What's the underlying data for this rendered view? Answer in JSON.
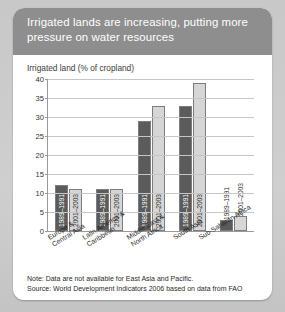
{
  "card": {
    "title": "Irrigated lands are increasing, putting more pressure on water resources"
  },
  "footnotes": {
    "note": "Note: Data are not available for East Asia and Pacific.",
    "source": "Source: World Development Indicators 2006 based on data from FAO"
  },
  "chart_data": {
    "type": "bar",
    "title": "Irrigated land (% of cropland)",
    "xlabel": "",
    "ylabel": "Irrigated land (% of cropland)",
    "ylim": [
      0,
      40
    ],
    "yticks": [
      0,
      5,
      10,
      15,
      20,
      25,
      30,
      35,
      40
    ],
    "grid": true,
    "legend_position": "in-bar-labels",
    "categories": [
      "Europe & Central Asia",
      "Latin America & Caribbean",
      "Middle East & North Africa",
      "South Asia",
      "Sub-Saharan Africa"
    ],
    "series": [
      {
        "name": "1989–1991",
        "color": "#5b5b5b",
        "values": [
          12,
          11,
          29,
          33,
          3
        ]
      },
      {
        "name": "2001–2003",
        "color": "#d6d6d6",
        "values": [
          11,
          11,
          33,
          39,
          4
        ]
      }
    ]
  }
}
